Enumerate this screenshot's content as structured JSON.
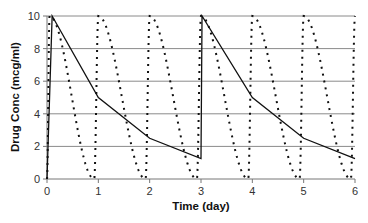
{
  "chart_data": {
    "type": "line",
    "title": "",
    "xlabel": "Time (day)",
    "ylabel": "Drug Conc (mcg/ml)",
    "xlim": [
      0,
      6
    ],
    "ylim": [
      0,
      10
    ],
    "x_ticks": [
      "0",
      "1",
      "2",
      "3",
      "4",
      "5",
      "6"
    ],
    "y_ticks": [
      "0",
      "2",
      "4",
      "6",
      "8",
      "10"
    ],
    "grid": "horizontal",
    "legend": "none",
    "series": [
      {
        "name": "Solid line (dosing every 3 days)",
        "style": "solid",
        "color": "#111111",
        "x": [
          0,
          0.1,
          1,
          2,
          3,
          3.02,
          4,
          5,
          6
        ],
        "y": [
          0,
          10,
          5,
          2.5,
          1.25,
          10,
          5,
          2.5,
          1.25
        ]
      },
      {
        "name": "Dotted line (daily dosing)",
        "style": "dotted",
        "color": "#111111",
        "peaks_x": [
          0.05,
          1,
          2,
          3,
          4,
          5,
          6
        ],
        "peak_value": 10,
        "troughs_x": [
          0.92,
          1.92,
          2.92,
          3.92,
          4.92,
          5.92
        ],
        "trough_value": 0
      }
    ]
  }
}
